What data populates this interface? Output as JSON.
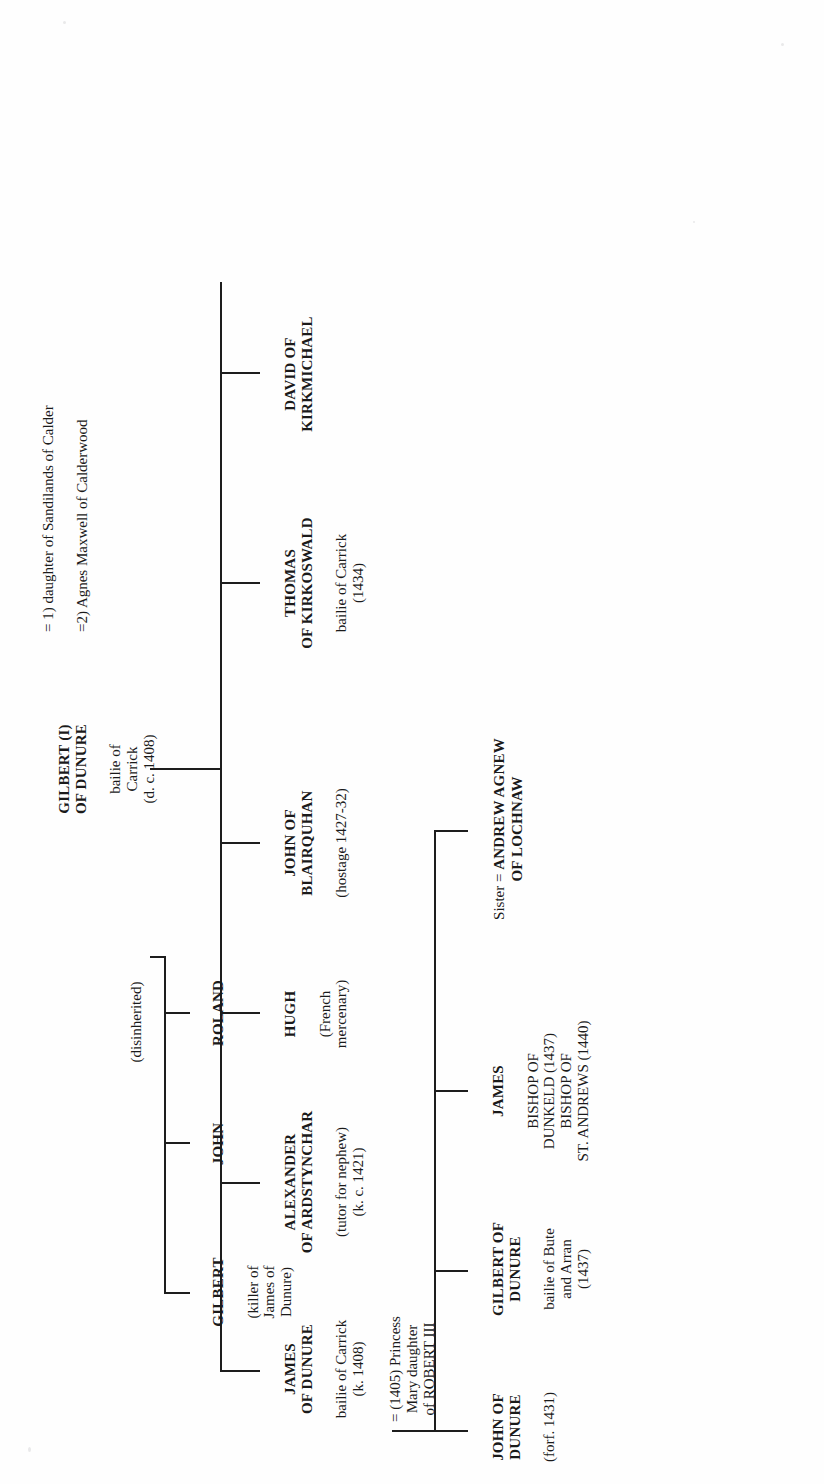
{
  "document": {
    "type": "genealogical-tree",
    "title": "Kennedy of Dunure family tree",
    "orientation": "rotated-90-ccw",
    "background_color": "#ffffff",
    "ink_color": "#1d1d1d"
  },
  "root": {
    "name": "GILBERT (I)\nOF DUNURE",
    "detail": "bailie of\nCarrick\n(d. c. 1408)"
  },
  "marriages": [
    {
      "label": "= 1) daughter of Sandilands of Calder"
    },
    {
      "label": "=2) Agnes Maxwell of Calderwood"
    }
  ],
  "notes": [
    {
      "label": "(disinherited)"
    }
  ],
  "generation_1": [
    {
      "name": "JAMES\nOF DUNURE",
      "detail": "bailie of Carrick\n(k. 1408)",
      "marriage": "= (1405) Princess\nMary daughter\nof ROBERT III"
    },
    {
      "name": "ALEXANDER\nOF ARDSTYNCHAR",
      "detail": "(tutor for nephew)\n(k. c. 1421)"
    },
    {
      "name": "HUGH",
      "detail": "(French\nmercenary)"
    },
    {
      "name": "JOHN OF\nBLAIRQUHAN",
      "detail": "(hostage 1427-32)"
    },
    {
      "name": "THOMAS\nOF KIRKOSWALD",
      "detail": "bailie of Carrick\n(1434)"
    },
    {
      "name": "DAVID OF\nKIRKMICHAEL",
      "detail": ""
    }
  ],
  "disinherited_branch": [
    {
      "name": "GILBERT",
      "detail": "(killer of\nJames of\nDunure)"
    },
    {
      "name": "JOHN",
      "detail": ""
    },
    {
      "name": "ROLAND",
      "detail": ""
    }
  ],
  "generation_2": [
    {
      "name": "JOHN OF\nDUNURE",
      "detail": "(forf. 1431)"
    },
    {
      "name": "GILBERT OF\nDUNURE",
      "detail": "bailie of Bute\nand Arran\n(1437)"
    },
    {
      "name": "JAMES",
      "detail": "BISHOP OF\nDUNKELD (1437)\nBISHOP OF\nST. ANDREWS (1440)"
    },
    {
      "name": "Sister = ANDREW AGNEW\nOF LOCHNAW",
      "detail": ""
    }
  ],
  "sister_entry": {
    "prefix": "Sister = ",
    "spouse": "ANDREW AGNEW\nOF LOCHNAW"
  }
}
